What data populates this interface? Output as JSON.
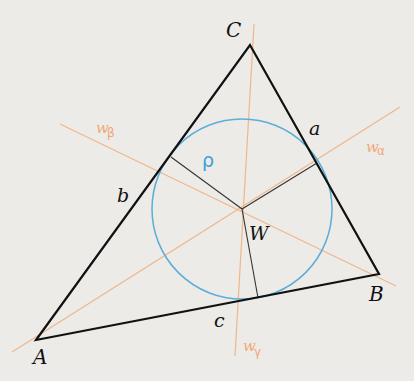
{
  "diagram": {
    "colors": {
      "background": "#ecebe8",
      "triangle": "#111111",
      "bisector": "#f0b68a",
      "incircle": "#5aaed8",
      "radius": "#333333",
      "bisector_label": "#f0a878",
      "rho_label": "#3ea0d8"
    },
    "vertices": {
      "A": {
        "label": "A",
        "x": 36,
        "y": 340
      },
      "B": {
        "label": "B",
        "x": 379,
        "y": 274
      },
      "C": {
        "label": "C",
        "x": 250,
        "y": 45
      }
    },
    "sides": {
      "a": {
        "label": "a"
      },
      "b": {
        "label": "b"
      },
      "c": {
        "label": "c"
      }
    },
    "incenter": {
      "label": "W",
      "x": 242,
      "y": 209
    },
    "incircle": {
      "cx": 242,
      "cy": 209,
      "r": 90,
      "radius_label": "ρ"
    },
    "bisectors": {
      "alpha": {
        "label_base": "w",
        "label_sub": "α"
      },
      "beta": {
        "label_base": "w",
        "label_sub": "β"
      },
      "gamma": {
        "label_base": "w",
        "label_sub": "γ"
      }
    }
  }
}
